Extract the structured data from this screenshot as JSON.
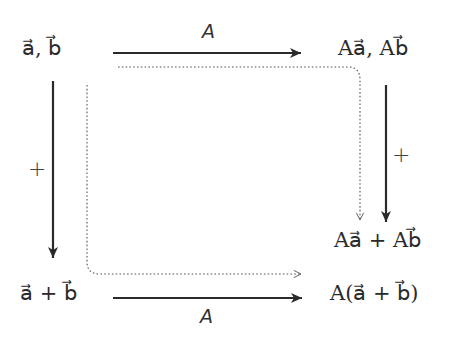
{
  "diagram": {
    "type": "commutative-diagram",
    "nodes": {
      "top_left": "a⃗, b⃗",
      "top_right": "Aa⃗, Ab⃗",
      "mid_right": "Aa⃗ + Ab⃗",
      "bottom_left": "a⃗ + b⃗",
      "bottom_right": "A(a⃗ + b⃗)"
    },
    "arrows": {
      "top": {
        "label": "A",
        "from": "top_left",
        "to": "top_right",
        "style": "solid"
      },
      "bottom": {
        "label": "A",
        "from": "bottom_left",
        "to": "bottom_right",
        "style": "solid"
      },
      "left": {
        "label": "+",
        "from": "top_left",
        "to": "bottom_left",
        "style": "solid"
      },
      "right": {
        "label": "+",
        "from": "top_right",
        "to": "mid_right",
        "style": "solid"
      },
      "dotted_top_path": {
        "from": "top_left",
        "to": "mid_right",
        "style": "dotted"
      },
      "dotted_bottom_path": {
        "from": "top_left",
        "to": "bottom_right",
        "style": "dotted"
      }
    },
    "colors": {
      "stroke": "#2a2a2a",
      "dotted": "#555555",
      "background": "#ffffff"
    }
  }
}
